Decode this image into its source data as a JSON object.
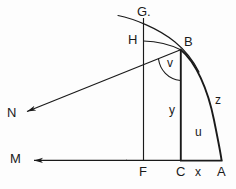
{
  "figure": {
    "kind": "geometric-diagram",
    "background_color": "#fdfdfd",
    "stroke_color": "#1a1a1a",
    "caption": "",
    "points": [
      {
        "id": "G",
        "label": "G.",
        "x": 140,
        "y": 12,
        "role": "curve-top-label"
      },
      {
        "id": "H",
        "label": "H",
        "x": 131,
        "y": 40,
        "role": "vertical-line-point"
      },
      {
        "id": "B",
        "label": "B",
        "x": 186,
        "y": 43,
        "role": "curve-point"
      },
      {
        "id": "N",
        "label": "N",
        "x": 9,
        "y": 114,
        "role": "ray-endpoint"
      },
      {
        "id": "M",
        "label": "M",
        "x": 13,
        "y": 160,
        "role": "ray-endpoint"
      },
      {
        "id": "F",
        "label": "F",
        "x": 140,
        "y": 172,
        "role": "baseline-point"
      },
      {
        "id": "C",
        "label": "C",
        "x": 177,
        "y": 172,
        "role": "baseline-point"
      },
      {
        "id": "A",
        "label": "A",
        "x": 218,
        "y": 172,
        "role": "baseline-point"
      }
    ],
    "segment_labels": [
      {
        "id": "v",
        "label": "v",
        "x": 169,
        "y": 64,
        "role": "angle-label"
      },
      {
        "id": "y",
        "label": "y",
        "x": 170,
        "y": 111,
        "role": "segment-label"
      },
      {
        "id": "u",
        "label": "u",
        "x": 197,
        "y": 133,
        "role": "region-label"
      },
      {
        "id": "z",
        "label": "z",
        "x": 216,
        "y": 101,
        "role": "arc-label"
      },
      {
        "id": "x",
        "label": "x",
        "x": 196,
        "y": 172,
        "role": "segment-label"
      }
    ]
  }
}
